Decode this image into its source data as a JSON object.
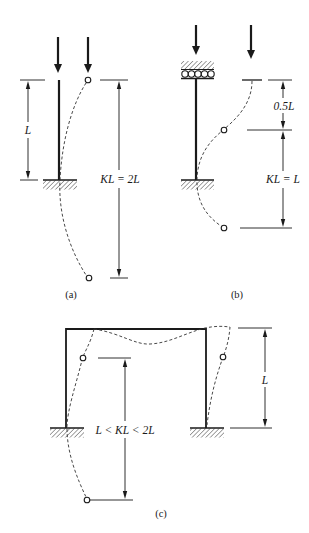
{
  "panels": {
    "a": {
      "caption": "(a)",
      "length_label": "L",
      "effective_length_label": "KL = 2L",
      "support": "fixed-base, free-top"
    },
    "b": {
      "caption": "(b)",
      "top_offset_label": "0.5L",
      "effective_length_label": "KL = L",
      "support": "fixed-base, roller-guided top"
    },
    "c": {
      "caption": "(c)",
      "height_label": "L",
      "effective_length_label": "L < KL < 2L",
      "support": "portal frame, fixed bases, sway permitted"
    }
  },
  "colors": {
    "ink": "#1a1a1a",
    "background": "#ffffff"
  }
}
